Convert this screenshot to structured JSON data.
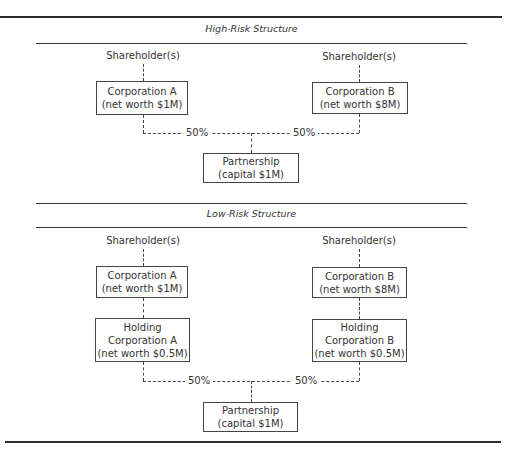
{
  "diagram": {
    "sections": [
      {
        "title": "High-Risk Structure",
        "left": {
          "shareholder": "Shareholder(s)",
          "corp_name": "Corporation A",
          "corp_value": "(net worth $1M)"
        },
        "right": {
          "shareholder": "Shareholder(s)",
          "corp_name": "Corporation B",
          "corp_value": "(net worth $8M)"
        },
        "left_share": "50%",
        "right_share": "50%",
        "partnership": {
          "name": "Partnership",
          "value": "(capital $1M)"
        }
      },
      {
        "title": "Low-Risk Structure",
        "left": {
          "shareholder": "Shareholder(s)",
          "corp_name": "Corporation A",
          "corp_value": "(net worth $1M)",
          "holding_line1": "Holding",
          "holding_line2": "Corporation A",
          "holding_value": "(net worth $0.5M)"
        },
        "right": {
          "shareholder": "Shareholder(s)",
          "corp_name": "Corporation B",
          "corp_value": "(net worth $8M)",
          "holding_line1": "Holding",
          "holding_line2": "Corporation B",
          "holding_value": "(net worth $0.5M)"
        },
        "left_share": "50%",
        "right_share": "50%",
        "partnership": {
          "name": "Partnership",
          "value": "(capital $1M)"
        }
      }
    ]
  }
}
